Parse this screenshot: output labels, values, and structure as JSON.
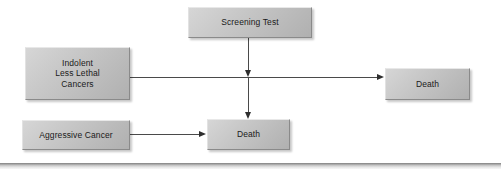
{
  "diagram": {
    "nodes": {
      "screening_test": {
        "label": "Screening Test"
      },
      "indolent": {
        "line1": "Indolent",
        "line2": "Less Lethal",
        "line3": "Cancers"
      },
      "aggressive": {
        "label": "Aggressive Cancer"
      },
      "death_right": {
        "label": "Death"
      },
      "death_bottom": {
        "label": "Death"
      }
    },
    "edges": [
      {
        "from": "screening_test",
        "to": "indolent_pathway",
        "kind": "arrow-down"
      },
      {
        "from": "screening_test",
        "to": "death_bottom",
        "kind": "arrow-down"
      },
      {
        "from": "indolent",
        "to": "death_right",
        "kind": "arrow-right"
      },
      {
        "from": "aggressive",
        "to": "death_bottom",
        "kind": "arrow-right"
      }
    ],
    "colors": {
      "box_fill_light": "#d6d6d6",
      "box_fill_dark": "#b0b0b0",
      "box_border": "#8a8a8a",
      "connector": "#4a4a4a",
      "arrowhead": "#2e2e2e",
      "text": "#1a1a1a",
      "background": "#ffffff"
    }
  }
}
